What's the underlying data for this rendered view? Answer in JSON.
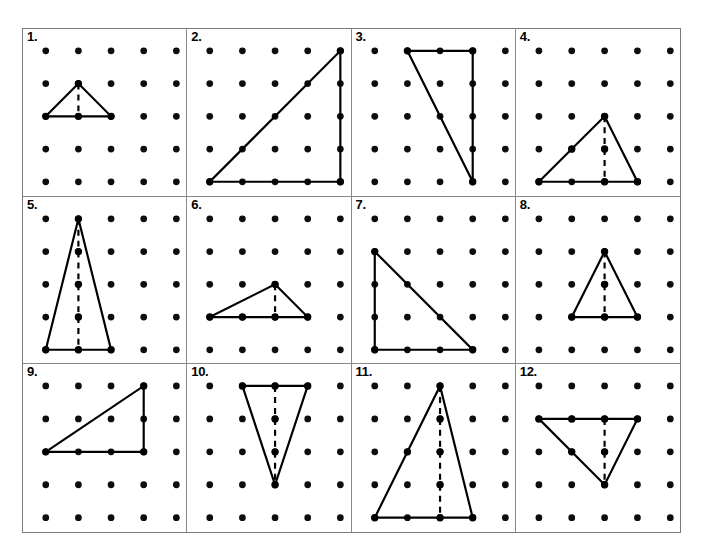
{
  "worksheet": {
    "title": "Triangles on Dot Grids",
    "grid_columns": 4,
    "grid_rows": 3,
    "dot_grid": {
      "cols": 5,
      "rows": 5,
      "dot_color": "#0d0d0d",
      "dot_radius": 3.4
    },
    "line_color": "#000000",
    "border_color": "#8a8a8a",
    "dash_pattern": "6 5"
  },
  "cells": [
    {
      "number": "1.",
      "vertices": [
        [
          0,
          2
        ],
        [
          1,
          1
        ],
        [
          2,
          2
        ]
      ],
      "altitude": {
        "from": [
          1,
          1
        ],
        "to": [
          1,
          2
        ]
      },
      "has_altitude": true,
      "marked_points": [
        [
          0,
          2
        ],
        [
          1,
          1
        ],
        [
          2,
          2
        ],
        [
          1,
          2
        ]
      ]
    },
    {
      "number": "2.",
      "vertices": [
        [
          0,
          4
        ],
        [
          4,
          4
        ],
        [
          4,
          0
        ]
      ],
      "altitude": null,
      "has_altitude": false,
      "marked_points": [
        [
          0,
          4
        ],
        [
          4,
          4
        ],
        [
          4,
          0
        ]
      ]
    },
    {
      "number": "3.",
      "vertices": [
        [
          1,
          0
        ],
        [
          3,
          0
        ],
        [
          3,
          4
        ]
      ],
      "altitude": null,
      "has_altitude": false,
      "marked_points": [
        [
          1,
          0
        ],
        [
          3,
          0
        ],
        [
          3,
          4
        ]
      ]
    },
    {
      "number": "4.",
      "vertices": [
        [
          0,
          4
        ],
        [
          2,
          2
        ],
        [
          3,
          4
        ]
      ],
      "altitude": {
        "from": [
          2,
          2
        ],
        "to": [
          2,
          4
        ]
      },
      "has_altitude": true,
      "marked_points": [
        [
          0,
          4
        ],
        [
          2,
          2
        ],
        [
          3,
          4
        ],
        [
          2,
          4
        ],
        [
          2,
          3
        ],
        [
          1,
          3
        ]
      ]
    },
    {
      "number": "5.",
      "vertices": [
        [
          0,
          4
        ],
        [
          1,
          0
        ],
        [
          2,
          4
        ]
      ],
      "altitude": {
        "from": [
          1,
          0
        ],
        "to": [
          1,
          4
        ]
      },
      "has_altitude": true,
      "marked_points": [
        [
          0,
          4
        ],
        [
          1,
          0
        ],
        [
          2,
          4
        ],
        [
          1,
          4
        ],
        [
          1,
          1
        ],
        [
          1,
          2
        ],
        [
          1,
          3
        ]
      ]
    },
    {
      "number": "6.",
      "vertices": [
        [
          0,
          3
        ],
        [
          2,
          2
        ],
        [
          3,
          3
        ]
      ],
      "altitude": {
        "from": [
          2,
          2
        ],
        "to": [
          2,
          3
        ]
      },
      "has_altitude": true,
      "marked_points": [
        [
          0,
          3
        ],
        [
          2,
          2
        ],
        [
          3,
          3
        ],
        [
          2,
          3
        ],
        [
          1,
          3
        ]
      ]
    },
    {
      "number": "7.",
      "vertices": [
        [
          0,
          1
        ],
        [
          0,
          4
        ],
        [
          3,
          4
        ]
      ],
      "altitude": null,
      "has_altitude": false,
      "marked_points": [
        [
          0,
          1
        ],
        [
          0,
          4
        ],
        [
          3,
          4
        ]
      ]
    },
    {
      "number": "8.",
      "vertices": [
        [
          1,
          3
        ],
        [
          2,
          1
        ],
        [
          3,
          3
        ]
      ],
      "altitude": {
        "from": [
          2,
          1
        ],
        "to": [
          2,
          3
        ]
      },
      "has_altitude": true,
      "marked_points": [
        [
          1,
          3
        ],
        [
          2,
          1
        ],
        [
          3,
          3
        ],
        [
          2,
          3
        ],
        [
          2,
          2
        ]
      ]
    },
    {
      "number": "9.",
      "vertices": [
        [
          0,
          2
        ],
        [
          3,
          0
        ],
        [
          3,
          2
        ]
      ],
      "altitude": null,
      "has_altitude": false,
      "marked_points": [
        [
          0,
          2
        ],
        [
          3,
          0
        ],
        [
          3,
          2
        ]
      ]
    },
    {
      "number": "10.",
      "vertices": [
        [
          1,
          0
        ],
        [
          3,
          0
        ],
        [
          2,
          3
        ]
      ],
      "altitude": {
        "from": [
          2,
          0
        ],
        "to": [
          2,
          3
        ]
      },
      "has_altitude": true,
      "marked_points": [
        [
          1,
          0
        ],
        [
          3,
          0
        ],
        [
          2,
          3
        ],
        [
          2,
          0
        ],
        [
          2,
          1
        ],
        [
          2,
          2
        ]
      ]
    },
    {
      "number": "11.",
      "vertices": [
        [
          0,
          4
        ],
        [
          2,
          0
        ],
        [
          3,
          4
        ]
      ],
      "altitude": {
        "from": [
          2,
          0
        ],
        "to": [
          2,
          4
        ]
      },
      "has_altitude": true,
      "marked_points": [
        [
          0,
          4
        ],
        [
          2,
          0
        ],
        [
          3,
          4
        ],
        [
          2,
          4
        ],
        [
          2,
          1
        ],
        [
          2,
          2
        ],
        [
          2,
          3
        ],
        [
          1,
          2
        ]
      ]
    },
    {
      "number": "12.",
      "vertices": [
        [
          0,
          1
        ],
        [
          3,
          1
        ],
        [
          2,
          3
        ]
      ],
      "altitude": {
        "from": [
          2,
          1
        ],
        "to": [
          2,
          3
        ]
      },
      "has_altitude": true,
      "marked_points": [
        [
          0,
          1
        ],
        [
          3,
          1
        ],
        [
          2,
          3
        ],
        [
          2,
          1
        ],
        [
          2,
          2
        ],
        [
          1,
          1
        ],
        [
          1,
          2
        ]
      ]
    }
  ]
}
